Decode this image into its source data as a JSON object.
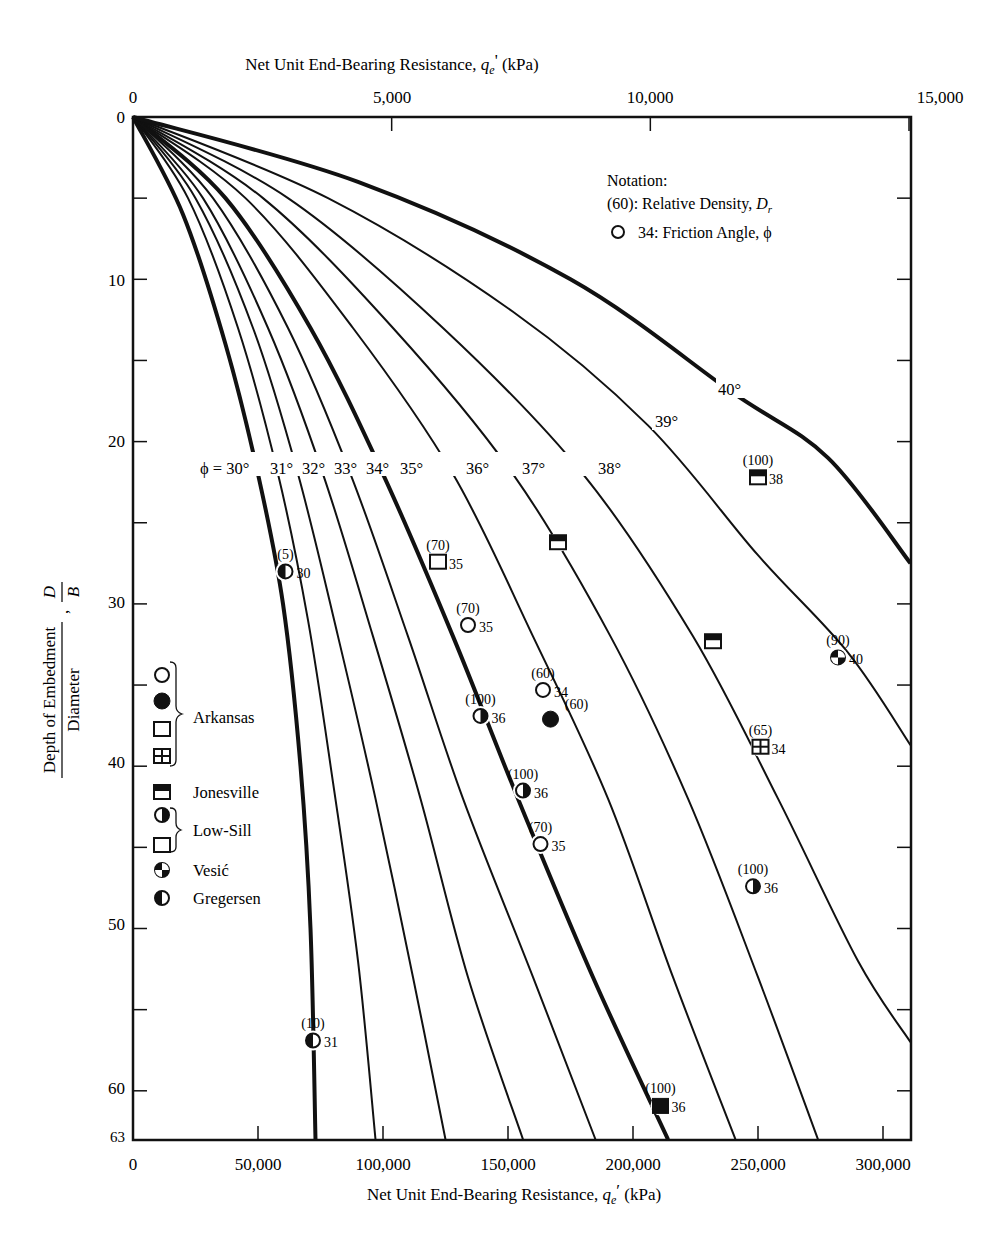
{
  "chart_data": {
    "type": "line",
    "title": "",
    "top_axis": {
      "label": "Net Unit End-Bearing Resistance, q_e' (kPa)",
      "ticks": [
        "0",
        "5,000",
        "10,000",
        "15,000"
      ],
      "tick_values": [
        0,
        5000,
        10000,
        15000
      ]
    },
    "xlabel": "Net Unit End-Bearing Resistance, q_e' (kPa)",
    "x_ticks": [
      "0",
      "50,000",
      "100,000",
      "150,000",
      "200,000",
      "250,000",
      "300,000"
    ],
    "x_tick_values": [
      0,
      50000,
      100000,
      150000,
      200000,
      250000,
      300000
    ],
    "xlim": [
      0,
      311000
    ],
    "ylabel": "Depth of Embedment / Diameter, D/B",
    "ylabel_numerator": "Depth of Embedment",
    "ylabel_denominator": "Diameter",
    "ylabel_symbol_num": "D",
    "ylabel_symbol_den": "B",
    "y_ticks": [
      "0",
      "10",
      "20",
      "30",
      "40",
      "50",
      "60",
      "63"
    ],
    "y_tick_values": [
      0,
      10,
      20,
      30,
      40,
      50,
      60,
      63
    ],
    "ylim": [
      0,
      63
    ],
    "y_inverted": true,
    "grid": false,
    "series": [
      {
        "name": "30°",
        "label": "ϕ = 30°",
        "thick": true,
        "points": [
          [
            0,
            0
          ],
          [
            20000,
            6
          ],
          [
            37000,
            14
          ],
          [
            50000,
            22
          ],
          [
            60000,
            30
          ],
          [
            67000,
            40
          ],
          [
            71000,
            50
          ],
          [
            73000,
            63
          ]
        ]
      },
      {
        "name": "31°",
        "label": "31°",
        "thick": false,
        "points": [
          [
            0,
            0
          ],
          [
            22000,
            5
          ],
          [
            42000,
            13
          ],
          [
            58000,
            22
          ],
          [
            70000,
            31
          ],
          [
            80000,
            41
          ],
          [
            90000,
            52
          ],
          [
            97000,
            63
          ]
        ]
      },
      {
        "name": "32°",
        "label": "32°",
        "thick": false,
        "points": [
          [
            0,
            0
          ],
          [
            25000,
            5
          ],
          [
            48000,
            13
          ],
          [
            66000,
            22
          ],
          [
            82000,
            32
          ],
          [
            97000,
            42
          ],
          [
            112000,
            53
          ],
          [
            125000,
            63
          ]
        ]
      },
      {
        "name": "33°",
        "label": "33°",
        "thick": false,
        "points": [
          [
            0,
            0
          ],
          [
            28000,
            5
          ],
          [
            54000,
            13
          ],
          [
            76000,
            22
          ],
          [
            96000,
            32
          ],
          [
            115000,
            42
          ],
          [
            134000,
            53
          ],
          [
            156000,
            63
          ]
        ]
      },
      {
        "name": "34°",
        "label": "34°",
        "thick": false,
        "points": [
          [
            0,
            0
          ],
          [
            32000,
            5
          ],
          [
            62000,
            13
          ],
          [
            87000,
            22
          ],
          [
            110000,
            32
          ],
          [
            132000,
            42
          ],
          [
            160000,
            53
          ],
          [
            185000,
            63
          ]
        ]
      },
      {
        "name": "35°",
        "label": "35°",
        "thick": true,
        "points": [
          [
            0,
            0
          ],
          [
            37000,
            5
          ],
          [
            71000,
            13
          ],
          [
            100000,
            22
          ],
          [
            128000,
            32
          ],
          [
            154000,
            42
          ],
          [
            184000,
            53
          ],
          [
            214000,
            63
          ]
        ]
      },
      {
        "name": "36°",
        "label": "36°",
        "thick": false,
        "points": [
          [
            0,
            0
          ],
          [
            45000,
            5
          ],
          [
            88000,
            13
          ],
          [
            128000,
            22
          ],
          [
            160000,
            32
          ],
          [
            190000,
            42
          ],
          [
            216000,
            53
          ],
          [
            241000,
            63
          ]
        ]
      },
      {
        "name": "37°",
        "label": "37°",
        "thick": false,
        "points": [
          [
            0,
            0
          ],
          [
            52000,
            5
          ],
          [
            104000,
            13
          ],
          [
            152000,
            22
          ],
          [
            191000,
            32
          ],
          [
            222000,
            42
          ],
          [
            250000,
            53
          ],
          [
            274000,
            63
          ]
        ]
      },
      {
        "name": "38°",
        "label": "38°",
        "thick": false,
        "points": [
          [
            0,
            0
          ],
          [
            62000,
            5
          ],
          [
            124000,
            13
          ],
          [
            180000,
            22
          ],
          [
            224000,
            32
          ],
          [
            258000,
            42
          ],
          [
            290000,
            52
          ],
          [
            311000,
            57
          ]
        ]
      },
      {
        "name": "39°",
        "label": "39°",
        "thick": false,
        "points": [
          [
            0,
            0
          ],
          [
            78000,
            5
          ],
          [
            152000,
            12
          ],
          [
            206000,
            19
          ],
          [
            250000,
            27
          ],
          [
            286000,
            33
          ],
          [
            311000,
            38.7
          ]
        ]
      },
      {
        "name": "40°",
        "label": "40°",
        "thick": true,
        "points": [
          [
            0,
            0
          ],
          [
            90000,
            4
          ],
          [
            175000,
            10
          ],
          [
            240000,
            17
          ],
          [
            278000,
            21
          ],
          [
            311000,
            27.5
          ]
        ]
      }
    ],
    "data_points": [
      {
        "site": "Arkansas",
        "symbol": "open-circle",
        "dr": "(70)",
        "phi": "35",
        "x": 134000,
        "y": 31.3
      },
      {
        "site": "Arkansas",
        "symbol": "open-circle",
        "dr": "(60)",
        "phi": "34",
        "x": 164000,
        "y": 35.3
      },
      {
        "site": "Arkansas",
        "symbol": "open-circle",
        "dr": "(70)",
        "phi": "35",
        "x": 163000,
        "y": 44.8
      },
      {
        "site": "Arkansas",
        "symbol": "filled-circle",
        "dr": "(60)",
        "phi": "",
        "x": 167000,
        "y": 37.1
      },
      {
        "site": "Arkansas",
        "symbol": "open-square",
        "dr": "(70)",
        "phi": "35",
        "x": 122000,
        "y": 27.4
      },
      {
        "site": "Arkansas",
        "symbol": "grid-square",
        "dr": "(65)",
        "phi": "34",
        "x": 251000,
        "y": 38.8
      },
      {
        "site": "Jonesville",
        "symbol": "half-filled-square",
        "dr": "(100)",
        "phi": "38",
        "x": 250000,
        "y": 22.2
      },
      {
        "site": "Jonesville",
        "symbol": "half-filled-square",
        "dr": "",
        "phi": "",
        "x": 170000,
        "y": 26.2
      },
      {
        "site": "Jonesville",
        "symbol": "half-filled-square",
        "dr": "",
        "phi": "",
        "x": 232000,
        "y": 32.3
      },
      {
        "site": "Low-Sill",
        "symbol": "half-filled-circle-right",
        "dr": "(100)",
        "phi": "36",
        "x": 139000,
        "y": 36.9
      },
      {
        "site": "Low-Sill",
        "symbol": "half-filled-circle-right",
        "dr": "(100)",
        "phi": "36",
        "x": 156000,
        "y": 41.5
      },
      {
        "site": "Low-Sill",
        "symbol": "half-filled-circle-right",
        "dr": "(100)",
        "phi": "36",
        "x": 248000,
        "y": 47.4
      },
      {
        "site": "Low-Sill",
        "symbol": "filled-square",
        "dr": "(100)",
        "phi": "36",
        "x": 211000,
        "y": 60.9
      },
      {
        "site": "Vesić",
        "symbol": "quartered-circle",
        "dr": "(90)",
        "phi": "40",
        "x": 282000,
        "y": 33.3
      },
      {
        "site": "Gregersen",
        "symbol": "half-filled-circle-left",
        "dr": "(5)",
        "phi": "30",
        "x": 61000,
        "y": 28.0
      },
      {
        "site": "Gregersen",
        "symbol": "half-filled-circle-left",
        "dr": "(10)",
        "phi": "31",
        "x": 72000,
        "y": 56.9
      }
    ],
    "legend": {
      "position": "left-inside",
      "groups": [
        {
          "label": "Arkansas",
          "symbols": [
            "open-circle",
            "filled-circle",
            "open-square",
            "grid-square"
          ]
        },
        {
          "label": "Jonesville",
          "symbols": [
            "half-filled-square"
          ]
        },
        {
          "label": "Low-Sill",
          "symbols": [
            "half-filled-circle-right",
            "open-square"
          ]
        },
        {
          "label": "Vesić",
          "symbols": [
            "quartered-circle"
          ]
        },
        {
          "label": "Gregersen",
          "symbols": [
            "half-filled-circle-left"
          ]
        }
      ]
    },
    "notation": {
      "title": "Notation:",
      "line1": "(60): Relative Density, D_r",
      "line2": "34: Friction Angle, ϕ"
    }
  },
  "labels": {
    "top_axis_title_main": "Net Unit End-Bearing Resistance, ",
    "top_axis_q": "q",
    "top_axis_sub": "e",
    "top_axis_prime": "'",
    "top_axis_unit": " (kPa)",
    "bottom_axis_title_main": "Net Unit End-Bearing Resistance, ",
    "bottom_axis_q": "q",
    "bottom_axis_sub": "e",
    "bottom_axis_prime": "′",
    "bottom_axis_unit": " (kPa)",
    "notation_title": "Notation:",
    "notation_dr": "(60): Relative Density, ",
    "notation_dr_sym": "D",
    "notation_dr_sub": "r",
    "notation_phi": "34: Friction Angle, ϕ",
    "phi_prefix": "ϕ = 30°",
    "legend_arkansas": "Arkansas",
    "legend_jonesville": "Jonesville",
    "legend_lowsill": "Low-Sill",
    "legend_vesic": "Vesić",
    "legend_gregersen": "Gregersen",
    "ylabel_num": "Depth of Embedment",
    "ylabel_den": "Diameter",
    "ylabel_D": "D",
    "ylabel_B": "B"
  }
}
